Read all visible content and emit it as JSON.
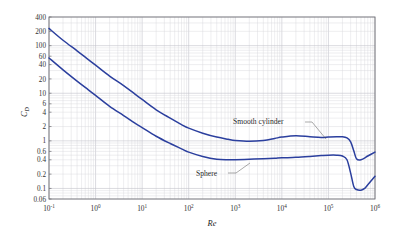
{
  "figure": {
    "background_color": "#ffffff",
    "frame_color": "#6e6e74",
    "grid_color": "#d9d9dd",
    "curve_color": "#2b3f9e"
  },
  "chart_data": {
    "type": "line",
    "title": "",
    "xlabel": "Re",
    "ylabel": "C_D",
    "xscale": "log",
    "yscale": "log",
    "xlim": [
      0.1,
      1000000
    ],
    "ylim": [
      0.06,
      400
    ],
    "grid": true,
    "legend_position": "inline-annotations",
    "xticks": [
      "10^-1",
      "10^0",
      "10^1",
      "10^2",
      "10^3",
      "10^4",
      "10^5",
      "10^6"
    ],
    "xtick_values": [
      0.1,
      1,
      10,
      100,
      1000,
      10000,
      100000,
      1000000
    ],
    "yticks": [
      "400",
      "200",
      "100",
      "60",
      "40",
      "20",
      "10",
      "6",
      "4",
      "2",
      "1",
      "0.6",
      "0.4",
      "0.2",
      "0.1",
      "0.06"
    ],
    "ytick_values": [
      400,
      200,
      100,
      60,
      40,
      20,
      10,
      6,
      4,
      2,
      1,
      0.6,
      0.4,
      0.2,
      0.1,
      0.06
    ],
    "series": [
      {
        "name": "Smooth cylinder",
        "color": "#2b3f9e",
        "x": [
          0.1,
          0.2,
          0.4,
          0.7,
          1,
          2,
          4,
          7,
          10,
          20,
          40,
          70,
          100,
          200,
          400,
          700,
          1000,
          2000,
          4000,
          7000,
          10000,
          20000,
          40000,
          70000,
          100000,
          150000,
          200000,
          250000,
          300000,
          350000,
          400000,
          500000,
          700000,
          1000000
        ],
        "y": [
          230,
          130,
          78,
          51,
          39,
          23,
          14.5,
          9.6,
          7.4,
          4.5,
          3.0,
          2.2,
          1.85,
          1.45,
          1.2,
          1.08,
          1.02,
          0.98,
          1.02,
          1.12,
          1.2,
          1.28,
          1.22,
          1.18,
          1.2,
          1.22,
          1.22,
          1.15,
          0.95,
          0.62,
          0.42,
          0.4,
          0.48,
          0.58
        ]
      },
      {
        "name": "Sphere",
        "color": "#2b3f9e",
        "x": [
          0.1,
          0.2,
          0.4,
          0.7,
          1,
          2,
          4,
          7,
          10,
          20,
          40,
          70,
          100,
          200,
          400,
          700,
          1000,
          2000,
          4000,
          7000,
          10000,
          20000,
          40000,
          70000,
          100000,
          150000,
          200000,
          250000,
          300000,
          350000,
          400000,
          500000,
          600000,
          700000,
          1000000
        ],
        "y": [
          55,
          31,
          18,
          11.8,
          9.0,
          5.3,
          3.4,
          2.35,
          1.9,
          1.25,
          0.88,
          0.68,
          0.58,
          0.47,
          0.41,
          0.4,
          0.4,
          0.41,
          0.42,
          0.43,
          0.44,
          0.45,
          0.47,
          0.49,
          0.5,
          0.5,
          0.48,
          0.4,
          0.21,
          0.11,
          0.095,
          0.092,
          0.1,
          0.12,
          0.18
        ]
      }
    ],
    "annotations": [
      {
        "text": "Smooth cylinder",
        "target_series": "Smooth cylinder"
      },
      {
        "text": "Sphere",
        "target_series": "Sphere"
      }
    ]
  }
}
